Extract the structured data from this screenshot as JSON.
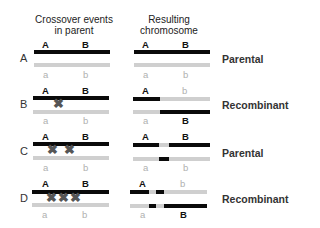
{
  "headers": {
    "left": [
      "Crossover events",
      "in parent"
    ],
    "right": [
      "Resulting",
      "chromosome"
    ]
  },
  "alleles": {
    "upper": [
      "A",
      "B"
    ],
    "lower": [
      "a",
      "b"
    ]
  },
  "colors": {
    "dominant": "#0a0a0a",
    "recessive": "#cfcfcf",
    "cross": "#555555"
  },
  "rows": [
    {
      "id": "A",
      "crossovers": 0,
      "result": "Parental",
      "result_labels": {
        "top": [
          "A",
          "b"
        ],
        "bottom": [
          "a",
          "B"
        ]
      }
    },
    {
      "id": "B",
      "crossovers": 1,
      "result": "Recombinant"
    },
    {
      "id": "C",
      "crossovers": 2,
      "result": "Parental"
    },
    {
      "id": "D",
      "crossovers": 3,
      "result": "Recombinant"
    }
  ],
  "labels": {
    "rowA": {
      "id": "A",
      "res_top1": "A",
      "res_top2": "B",
      "res_bot1": "a",
      "res_bot2": "b",
      "result": "Parental"
    },
    "rowB": {
      "id": "B",
      "res_top1": "A",
      "res_top2": "b",
      "res_bot1": "a",
      "res_bot2": "B",
      "result": "Recombinant"
    },
    "rowC": {
      "id": "C",
      "res_top1": "A",
      "res_top2": "B",
      "res_bot1": "a",
      "res_bot2": "b",
      "result": "Parental"
    },
    "rowD": {
      "id": "D",
      "res_top1": "A",
      "res_top2": "b",
      "res_bot1": "a",
      "res_bot2": "B",
      "result": "Recombinant"
    }
  },
  "cross_glyph": "✖"
}
